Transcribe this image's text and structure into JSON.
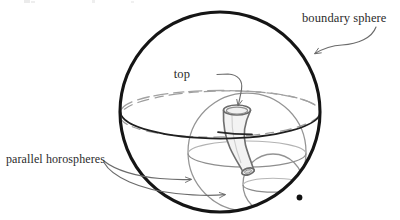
{
  "figure": {
    "domain": "diagram",
    "caption_present": false,
    "background_color": "#ffffff",
    "width": 400,
    "height": 220,
    "labels": {
      "boundary_sphere": "boundary sphere",
      "top": "top",
      "parallel_horospheres": "parallel horospheres"
    },
    "colors": {
      "boundary_stroke": "#161616",
      "equator_front_stroke": "#1d1d1d",
      "equator_back_stroke": "#9a9a9a",
      "horosphere_stroke": "#8d8d8d",
      "funnel_stroke": "#6f6f6f",
      "funnel_fill": "#f4f4f4",
      "leader_stroke": "#6b6b6b",
      "text_color": "#2b2b2b",
      "tangency_dot": "#121212"
    },
    "geometry": {
      "boundary_sphere": {
        "cx": 220,
        "cy": 112,
        "r": 100,
        "stroke_width": 3.1
      },
      "main_horosphere_equator": {
        "cx": 220,
        "cy": 114,
        "rx": 100,
        "ry": 23
      },
      "middle_horosphere": {
        "cx": 247,
        "cy": 152,
        "r": 59
      },
      "middle_horosphere_equator": {
        "cx": 247,
        "cy": 155,
        "rx": 59,
        "ry": 15
      },
      "small_horosphere": {
        "cx": 273,
        "cy": 184,
        "r": 30
      },
      "small_horosphere_equator": {
        "cx": 273,
        "cy": 186,
        "rx": 30,
        "ry": 8
      },
      "tangency_point": {
        "x": 299,
        "y": 198
      },
      "funnel_top_ellipse": {
        "cx": 237,
        "cy": 110,
        "rx": 13.5,
        "ry": 5.0
      },
      "funnel_bottom_ellipse": {
        "cx": 248,
        "cy": 172,
        "rx": 6.0,
        "ry": 3.0
      }
    },
    "elements": [
      {
        "name": "boundary-sphere",
        "kind": "circle",
        "description": "thick dark outer circle representing the boundary sphere at infinity"
      },
      {
        "name": "main-horosphere",
        "kind": "ellipse",
        "description": "largest horosphere cross-section drawn as an ellipse, dark in front and dashed gray behind"
      },
      {
        "name": "middle-horosphere",
        "kind": "circle",
        "description": "medium gray horosphere tangent to the boundary sphere at the lower right"
      },
      {
        "name": "small-horosphere",
        "kind": "circle",
        "description": "small gray horosphere tangent to the boundary sphere at the same point"
      },
      {
        "name": "funnel",
        "kind": "surface",
        "description": "tapering horn/funnel surface descending from its top opening into the small horosphere"
      },
      {
        "name": "tangency-dot",
        "kind": "dot",
        "description": "dark dot marking the common point of tangency on the boundary sphere"
      }
    ],
    "leaders": [
      {
        "name": "boundary-sphere-leader",
        "from_label": "boundary sphere",
        "to_element": "boundary-sphere",
        "style": "curved arrow pointing down-left"
      },
      {
        "name": "top-leader",
        "from_label": "top",
        "to_element": "funnel-top-opening",
        "style": "curved arrow pointing down-right then down"
      },
      {
        "name": "parallel-horospheres-leader-1",
        "from_label": "parallel horospheres",
        "to_element": "middle-horosphere",
        "style": "long shallow curved arrow pointing right"
      },
      {
        "name": "parallel-horospheres-leader-2",
        "from_label": "parallel horospheres",
        "to_element": "small-horosphere",
        "style": "long shallow curved arrow pointing right"
      }
    ]
  }
}
